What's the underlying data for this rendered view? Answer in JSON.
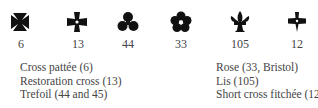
{
  "symbols": [
    {
      "icon": "cross-pattee-icon",
      "number": "6"
    },
    {
      "icon": "restoration-cross-icon",
      "number": "13"
    },
    {
      "icon": "trefoil-icon",
      "number": "44"
    },
    {
      "icon": "rose-icon",
      "number": "33"
    },
    {
      "icon": "lis-icon",
      "number": "105"
    },
    {
      "icon": "short-cross-fitchee-icon",
      "number": "12"
    }
  ],
  "legend_left": [
    "Cross pattée (6)",
    "Restoration cross (13)",
    "Trefoil (44 and 45)"
  ],
  "legend_right": [
    "Rose (33, Bristol)",
    "Lis (105)",
    "Short cross fitchée (12)"
  ],
  "colors": {
    "symbol": "#111111",
    "text": "#444444"
  }
}
